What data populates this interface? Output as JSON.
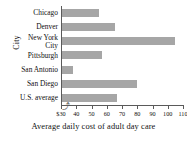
{
  "chart_data": {
    "type": "bar",
    "orientation": "horizontal",
    "title": "",
    "xlabel": "Average daily cost of adult day care",
    "ylabel": "City",
    "categories": [
      "Chicago",
      "Denver",
      "New York\nCity",
      "Pittsburgh",
      "San Antonio",
      "San Diego",
      "U.S. average"
    ],
    "values": [
      54,
      65,
      104,
      56,
      37,
      79,
      66
    ],
    "xlim": [
      30,
      110
    ],
    "xticks": [
      30,
      40,
      50,
      60,
      70,
      80,
      90,
      100,
      110
    ],
    "xtick_labels": [
      "$30",
      "40",
      "50",
      "60",
      "70",
      "80",
      "90",
      "100",
      "110"
    ],
    "axis_break": true,
    "grid": false,
    "legend": "none",
    "bar_color": "#a6a6a6",
    "axis_color": "#5a5a5a"
  },
  "axes": {
    "y_title": "City",
    "x_title": "Average daily cost of adult day care",
    "break_symbol": "⤴"
  }
}
